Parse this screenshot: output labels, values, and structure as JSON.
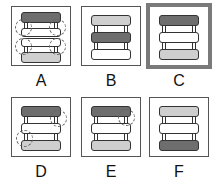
{
  "options": [
    {
      "label": "A",
      "bars": [
        "dark",
        "white",
        "white",
        "light"
      ],
      "circles": 4,
      "selected": false
    },
    {
      "label": "B",
      "bars": [
        "light",
        "dark",
        "white"
      ],
      "circles": 0,
      "selected": false
    },
    {
      "label": "C",
      "bars": [
        "dark",
        "white",
        "light"
      ],
      "circles": 0,
      "selected": true
    },
    {
      "label": "D",
      "bars": [
        "dark",
        "white",
        "light"
      ],
      "circles": 2,
      "selected": false
    },
    {
      "label": "E",
      "bars": [
        "dark",
        "white",
        "light"
      ],
      "circles": 1,
      "selected": false
    },
    {
      "label": "F",
      "bars": [
        "light",
        "white",
        "dark"
      ],
      "circles": 0,
      "selected": false
    }
  ],
  "colors": {
    "dark": "#6e6e6e",
    "light": "#cfcfcf",
    "white": "#ffffff",
    "selected_border": "#7a7a7a"
  }
}
